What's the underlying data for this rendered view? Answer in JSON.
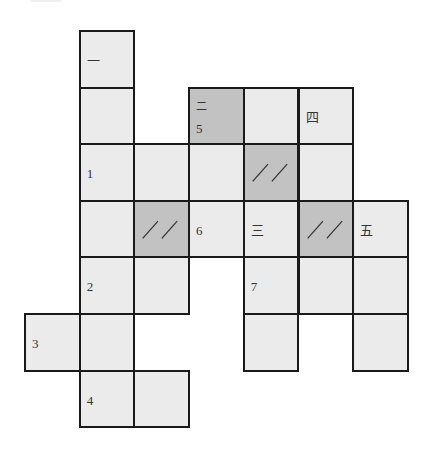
{
  "puzzle": {
    "type": "crossword-grid",
    "colors": {
      "cell_light": "#ebebeb",
      "cell_dark": "#c2c2c2",
      "border": "#1a1a1a"
    },
    "cells": [
      {
        "row": 0,
        "col": 1,
        "dark": false,
        "labels": [
          {
            "text": "一",
            "pos": "mid"
          }
        ]
      },
      {
        "row": 1,
        "col": 1,
        "dark": false,
        "labels": []
      },
      {
        "row": 1,
        "col": 3,
        "dark": true,
        "labels": [
          {
            "text": "二",
            "pos": "top"
          },
          {
            "text": "5",
            "pos": "low"
          }
        ]
      },
      {
        "row": 1,
        "col": 4,
        "dark": false,
        "labels": []
      },
      {
        "row": 1,
        "col": 5,
        "dark": false,
        "labels": [
          {
            "text": "四",
            "pos": "mid"
          }
        ]
      },
      {
        "row": 2,
        "col": 1,
        "dark": false,
        "labels": [
          {
            "text": "1",
            "pos": "mid"
          }
        ]
      },
      {
        "row": 2,
        "col": 2,
        "dark": false,
        "labels": []
      },
      {
        "row": 2,
        "col": 3,
        "dark": false,
        "labels": []
      },
      {
        "row": 2,
        "col": 4,
        "dark": true,
        "slashes": true,
        "labels": []
      },
      {
        "row": 2,
        "col": 5,
        "dark": false,
        "labels": []
      },
      {
        "row": 3,
        "col": 1,
        "dark": false,
        "labels": []
      },
      {
        "row": 3,
        "col": 2,
        "dark": true,
        "slashes": true,
        "labels": []
      },
      {
        "row": 3,
        "col": 3,
        "dark": false,
        "labels": [
          {
            "text": "6",
            "pos": "mid"
          }
        ]
      },
      {
        "row": 3,
        "col": 4,
        "dark": false,
        "labels": [
          {
            "text": "三",
            "pos": "mid"
          }
        ]
      },
      {
        "row": 3,
        "col": 5,
        "dark": true,
        "slashes": true,
        "labels": []
      },
      {
        "row": 3,
        "col": 6,
        "dark": false,
        "labels": [
          {
            "text": "五",
            "pos": "mid"
          }
        ]
      },
      {
        "row": 4,
        "col": 1,
        "dark": false,
        "labels": [
          {
            "text": "2",
            "pos": "mid"
          }
        ]
      },
      {
        "row": 4,
        "col": 2,
        "dark": false,
        "labels": []
      },
      {
        "row": 4,
        "col": 4,
        "dark": false,
        "labels": [
          {
            "text": "7",
            "pos": "mid"
          }
        ]
      },
      {
        "row": 4,
        "col": 5,
        "dark": false,
        "labels": []
      },
      {
        "row": 4,
        "col": 6,
        "dark": false,
        "labels": []
      },
      {
        "row": 5,
        "col": 0,
        "dark": false,
        "labels": [
          {
            "text": "3",
            "pos": "mid"
          }
        ]
      },
      {
        "row": 5,
        "col": 1,
        "dark": false,
        "labels": []
      },
      {
        "row": 5,
        "col": 4,
        "dark": false,
        "labels": []
      },
      {
        "row": 5,
        "col": 6,
        "dark": false,
        "labels": []
      },
      {
        "row": 6,
        "col": 1,
        "dark": false,
        "labels": [
          {
            "text": "4",
            "pos": "mid"
          }
        ]
      },
      {
        "row": 6,
        "col": 2,
        "dark": false,
        "labels": []
      }
    ]
  }
}
